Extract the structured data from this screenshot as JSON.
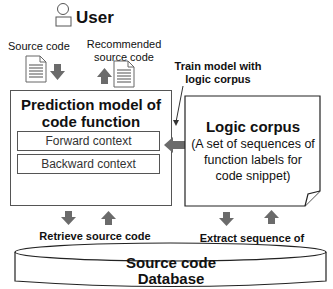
{
  "user": {
    "label": "User",
    "icon": "person-icon"
  },
  "inputs": {
    "source_code_label": "Source code",
    "recommended_label_line1": "Recommended",
    "recommended_label_line2": "source code"
  },
  "prediction_model": {
    "title_line1": "Prediction model of",
    "title_line2": "code function",
    "contexts": [
      "Forward context",
      "Backward context"
    ]
  },
  "train_note": {
    "line1": "Train model with",
    "line2": "logic corpus"
  },
  "logic_corpus": {
    "title": "Logic corpus",
    "desc_line1": "(A set of sequences of",
    "desc_line2": "function labels for",
    "desc_line3": "code snippet)"
  },
  "retrieve_note": {
    "line1": "Retrieve source code corresponding",
    "line2": "to predicted function label"
  },
  "extract_note": {
    "line1": "Extract sequence of",
    "line2": "function labels"
  },
  "database": {
    "line1": "Source code",
    "line2": "Database"
  },
  "colors": {
    "arrow": "#6b6b6b",
    "border": "#333333",
    "doc_lines": "#8a8a8a"
  }
}
